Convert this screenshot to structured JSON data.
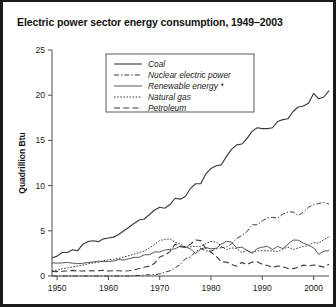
{
  "figure": {
    "title": "Electric power sector energy consumption, 1949–2003",
    "border_color": "#1a1a1a",
    "background": "#ffffff"
  },
  "axes": {
    "ylabel": "Quadrillion Btu",
    "y_ticks": [
      "0",
      "5",
      "10",
      "15",
      "20",
      "25"
    ],
    "x_ticks": [
      "1950",
      "1960",
      "1970",
      "1980",
      "1990",
      "2000"
    ]
  },
  "legend": {
    "items": [
      {
        "label": "Coal",
        "style": "solid",
        "key": "coal"
      },
      {
        "label": "Nuclear electric power",
        "style": "dashdot",
        "key": "nuclear"
      },
      {
        "label": "Renewable energy *",
        "style": "solid-thin",
        "key": "renewable"
      },
      {
        "label": "Natural gas",
        "style": "dotted",
        "key": "natural_gas"
      },
      {
        "label": "Petroleum",
        "style": "dashed",
        "key": "petroleum"
      }
    ]
  },
  "chart_data": {
    "type": "line",
    "title": "Electric power sector energy consumption, 1949–2003",
    "xlabel": "",
    "ylabel": "Quadrillion Btu",
    "xlim": [
      1949,
      2003
    ],
    "ylim": [
      0,
      25
    ],
    "grid": false,
    "legend_position": "top-center",
    "footnote_marker": "*",
    "x": [
      1949,
      1950,
      1951,
      1952,
      1953,
      1954,
      1955,
      1956,
      1957,
      1958,
      1959,
      1960,
      1961,
      1962,
      1963,
      1964,
      1965,
      1966,
      1967,
      1968,
      1969,
      1970,
      1971,
      1972,
      1973,
      1974,
      1975,
      1976,
      1977,
      1978,
      1979,
      1980,
      1981,
      1982,
      1983,
      1984,
      1985,
      1986,
      1987,
      1988,
      1989,
      1990,
      1991,
      1992,
      1993,
      1994,
      1995,
      1996,
      1997,
      1998,
      1999,
      2000,
      2001,
      2002,
      2003
    ],
    "series": [
      {
        "name": "Coal",
        "style": "solid",
        "values": [
          2.0,
          2.2,
          2.6,
          2.6,
          2.9,
          2.8,
          3.5,
          3.8,
          3.9,
          3.8,
          4.1,
          4.2,
          4.3,
          4.6,
          5.0,
          5.4,
          5.8,
          6.2,
          6.3,
          6.8,
          7.3,
          7.6,
          7.5,
          7.9,
          8.6,
          8.5,
          8.8,
          9.7,
          10.2,
          10.2,
          11.3,
          11.9,
          12.2,
          12.3,
          13.2,
          14.0,
          14.5,
          14.6,
          15.2,
          16.0,
          16.4,
          16.3,
          16.3,
          16.4,
          17.1,
          17.3,
          17.4,
          18.2,
          18.7,
          18.8,
          19.1,
          20.2,
          19.6,
          19.8,
          20.5
        ]
      },
      {
        "name": "Nuclear electric power",
        "style": "dashdot",
        "values": [
          0.0,
          0.0,
          0.0,
          0.0,
          0.0,
          0.0,
          0.0,
          0.0,
          0.0,
          0.0,
          0.0,
          0.0,
          0.0,
          0.0,
          0.0,
          0.0,
          0.04,
          0.06,
          0.09,
          0.14,
          0.15,
          0.24,
          0.41,
          0.58,
          0.91,
          1.27,
          1.9,
          2.11,
          2.7,
          3.02,
          2.78,
          2.74,
          3.01,
          3.13,
          3.2,
          3.55,
          4.15,
          4.47,
          4.91,
          5.66,
          5.68,
          6.1,
          6.42,
          6.48,
          6.41,
          6.84,
          7.08,
          7.09,
          6.68,
          7.07,
          7.61,
          7.86,
          8.03,
          8.15,
          7.96
        ]
      },
      {
        "name": "Renewable energy *",
        "style": "solid-thin",
        "values": [
          1.45,
          1.42,
          1.45,
          1.5,
          1.42,
          1.38,
          1.4,
          1.5,
          1.55,
          1.64,
          1.58,
          1.61,
          1.66,
          1.82,
          1.77,
          1.91,
          2.06,
          2.07,
          2.35,
          2.35,
          2.66,
          2.65,
          2.87,
          2.94,
          3.01,
          3.31,
          3.22,
          3.0,
          2.47,
          3.0,
          3.14,
          3.0,
          3.07,
          3.53,
          3.83,
          3.76,
          3.1,
          3.2,
          2.83,
          2.5,
          3.04,
          3.19,
          3.28,
          2.93,
          3.27,
          3.03,
          3.52,
          3.98,
          3.96,
          3.64,
          3.4,
          3.12,
          2.4,
          2.74,
          2.81
        ]
      },
      {
        "name": "Natural gas",
        "style": "dotted",
        "values": [
          0.6,
          0.65,
          0.8,
          0.9,
          1.0,
          1.1,
          1.2,
          1.35,
          1.45,
          1.5,
          1.7,
          1.79,
          1.85,
          1.95,
          2.1,
          2.25,
          2.4,
          2.6,
          2.75,
          3.1,
          3.5,
          3.93,
          4.05,
          4.1,
          3.73,
          3.53,
          3.24,
          3.22,
          3.29,
          3.23,
          3.6,
          3.81,
          3.77,
          3.3,
          2.91,
          3.11,
          3.04,
          2.6,
          2.84,
          2.64,
          2.79,
          2.79,
          2.79,
          2.76,
          2.68,
          2.99,
          3.2,
          2.93,
          3.1,
          3.27,
          3.36,
          3.7,
          3.63,
          4.04,
          4.35
        ]
      },
      {
        "name": "Petroleum",
        "style": "dashed",
        "values": [
          0.5,
          0.48,
          0.52,
          0.55,
          0.62,
          0.55,
          0.55,
          0.58,
          0.57,
          0.58,
          0.62,
          0.55,
          0.58,
          0.58,
          0.55,
          0.58,
          0.68,
          0.82,
          0.96,
          1.1,
          1.4,
          2.1,
          2.3,
          2.7,
          3.52,
          3.25,
          3.16,
          3.53,
          3.98,
          3.91,
          3.04,
          2.63,
          2.2,
          1.57,
          1.54,
          1.29,
          1.09,
          1.5,
          1.26,
          1.55,
          1.58,
          1.29,
          1.17,
          0.97,
          1.11,
          1.03,
          0.83,
          0.82,
          0.94,
          1.22,
          1.11,
          1.22,
          1.12,
          0.98,
          1.3
        ]
      }
    ]
  }
}
